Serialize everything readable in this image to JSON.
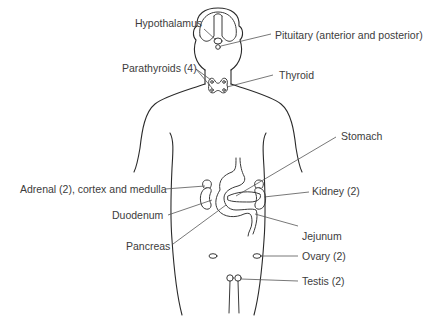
{
  "diagram": {
    "colors": {
      "line": "#2a2a2a",
      "leader": "#555555",
      "text": "#3c3c3c",
      "background": "#ffffff"
    },
    "labels": {
      "hypothalamus": "Hypothalamus",
      "pituitary": "Pituitary (anterior and posterior)",
      "parathyroids": "Parathyroids (4)",
      "thyroid": "Thyroid",
      "stomach": "Stomach",
      "adrenal": "Adrenal (2), cortex and medulla",
      "kidney": "Kidney (2)",
      "duodenum": "Duodenum",
      "jejunum": "Jejunum",
      "pancreas": "Pancreas",
      "ovary": "Ovary (2)",
      "testis": "Testis (2)"
    }
  }
}
